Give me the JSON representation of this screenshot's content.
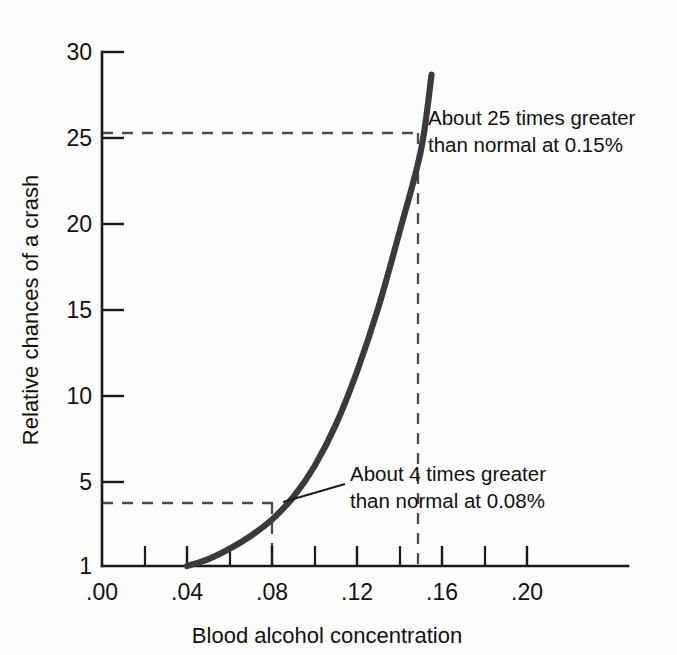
{
  "chart_data": {
    "type": "line",
    "title": "",
    "xlabel": "Blood alcohol concentration",
    "ylabel": "Relative chances of a crash",
    "xlim": [
      0.0,
      0.2228
    ],
    "ylim": [
      1,
      30
    ],
    "grid": false,
    "legend": false,
    "x_tick_labels": [
      ".00",
      ".04",
      ".08",
      ".12",
      ".16",
      ".20"
    ],
    "x_tick_values": [
      0.0,
      0.04,
      0.08,
      0.12,
      0.16,
      0.2
    ],
    "x_minor_tick_values": [
      0.02,
      0.06,
      0.1,
      0.14,
      0.18
    ],
    "y_tick_labels": [
      "1",
      "5",
      "10",
      "15",
      "20",
      "25",
      "30"
    ],
    "y_tick_values": [
      1,
      5,
      10,
      15,
      20,
      25,
      30
    ],
    "series": [
      {
        "name": "Relative crash risk",
        "x": [
          0.04,
          0.05,
          0.06,
          0.07,
          0.08,
          0.09,
          0.1,
          0.11,
          0.12,
          0.13,
          0.14,
          0.15,
          0.155
        ],
        "values": [
          1.0,
          1.4,
          2.0,
          2.75,
          3.7,
          5.0,
          6.8,
          9.2,
          12.3,
          16.0,
          20.4,
          25.1,
          29.5
        ]
      }
    ],
    "annotations": [
      {
        "id": "annot-25x",
        "line1": "About 25 times greater",
        "line2": "than normal at 0.15%",
        "point_x": 0.15,
        "point_y": 25.1
      },
      {
        "id": "annot-4x",
        "line1": "About 4 times greater",
        "line2": "than normal at 0.08%",
        "point_x": 0.08,
        "point_y": 3.7
      }
    ],
    "guides": [
      {
        "id": "guide-h-25",
        "type": "horizontal",
        "y": 25.1,
        "from_x": 0.0,
        "to_x": 0.1515
      },
      {
        "id": "guide-v-15",
        "type": "vertical",
        "x": 0.1487,
        "from_y": 1,
        "to_y": 25.1
      },
      {
        "id": "guide-h-4",
        "type": "horizontal",
        "y": 3.72,
        "from_x": 0.0,
        "to_x": 0.0805
      },
      {
        "id": "guide-v-08",
        "type": "vertical",
        "x": 0.0799,
        "from_y": 1,
        "to_y": 3.72
      }
    ],
    "colors": {
      "curve": "#3a3a3a",
      "axis": "#1a1a1a",
      "guide": "#4b4b4b",
      "text": "#111111",
      "background": "#fdfdfc"
    }
  }
}
